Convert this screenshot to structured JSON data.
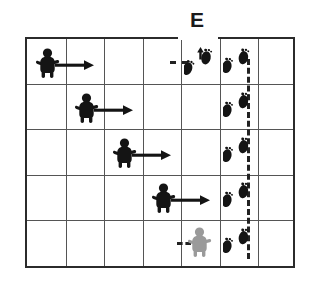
{
  "figure": {
    "label_e": "E",
    "colors": {
      "ink": "#1b1b1b",
      "grid_border": "#2b2b2b",
      "grid_inner": "#555555",
      "actor_black": "#141414",
      "actor_gray": "#9a9a9a",
      "dash": "#222222",
      "background": "#ffffff"
    },
    "grid": {
      "columns": 7,
      "rows": 5,
      "x": 25,
      "y": 37,
      "width": 270,
      "height": 231
    },
    "entry_marker": {
      "name": "E",
      "column": 6,
      "description": "dotted entry line from label E into grid at top of column 6"
    },
    "actors": [
      {
        "id": "actor-1",
        "color": "black",
        "row": 1,
        "col": 1,
        "arrow": "right"
      },
      {
        "id": "actor-2",
        "color": "black",
        "row": 2,
        "col": 2,
        "arrow": "right"
      },
      {
        "id": "actor-3",
        "color": "black",
        "row": 3,
        "col": 3,
        "arrow": "right"
      },
      {
        "id": "actor-4",
        "color": "black",
        "row": 4,
        "col": 4,
        "arrow": "right"
      },
      {
        "id": "actor-5",
        "color": "gray",
        "row": 5,
        "col": 5,
        "arrow": "none"
      }
    ],
    "footprints": [
      {
        "id": "feet-r1-c5",
        "row": 1,
        "col": 5,
        "turn": "up"
      },
      {
        "id": "feet-r1-c6",
        "row": 1,
        "col": 6,
        "turn": "none"
      },
      {
        "id": "feet-r2-c6",
        "row": 2,
        "col": 6,
        "turn": "none"
      },
      {
        "id": "feet-r3-c6",
        "row": 3,
        "col": 6,
        "turn": "none"
      },
      {
        "id": "feet-r4-c6",
        "row": 4,
        "col": 6,
        "turn": "none"
      },
      {
        "id": "feet-r5-c6",
        "row": 5,
        "col": 6,
        "turn": "none"
      }
    ],
    "paths": {
      "vertical_dashed_column": 6,
      "horizontal_connectors": [
        {
          "row": 1,
          "from_col": 5,
          "to_col": 6
        },
        {
          "row": 5,
          "from_col": 5,
          "to_col": 6
        }
      ]
    }
  }
}
